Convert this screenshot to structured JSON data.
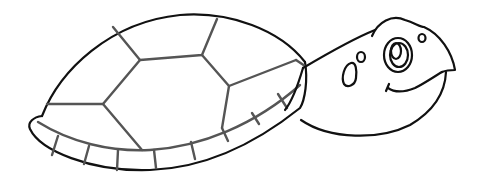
{
  "image": {
    "subject": "cartoon turtle line drawing",
    "style": "black outline coloring page",
    "colors": {
      "background": "#ffffff",
      "outline": "#111111",
      "shell_lines": "#555555"
    }
  }
}
